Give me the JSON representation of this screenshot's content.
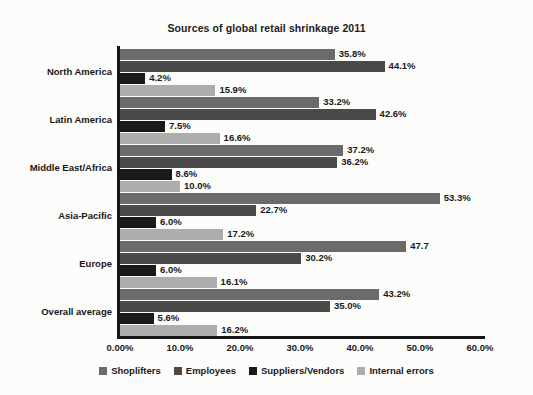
{
  "chart_data": {
    "type": "bar",
    "orientation": "horizontal",
    "title": "Sources of global retail shrinkage 2011",
    "xlabel": "",
    "ylabel": "",
    "xlim": [
      0,
      60
    ],
    "grid": false,
    "legend_position": "bottom",
    "xticks": [
      "0.00%",
      "10.0%",
      "20.0%",
      "30.0%",
      "40.0%",
      "50.0%",
      "60.0%"
    ],
    "xtick_values": [
      0,
      10,
      20,
      30,
      40,
      50,
      60
    ],
    "categories": [
      "North America",
      "Latin America",
      "Middle East/Africa",
      "Asia-Pacific",
      "Europe",
      "Overall average"
    ],
    "series": [
      {
        "name": "Shoplifters",
        "color": "#6b6b6b",
        "values": [
          35.8,
          33.2,
          37.2,
          53.3,
          47.7,
          43.2
        ],
        "labels": [
          "35.8%",
          "33.2%",
          "37.2%",
          "53.3%",
          "47.7",
          "43.2%"
        ]
      },
      {
        "name": "Employees",
        "color": "#4a4a4a",
        "values": [
          44.1,
          42.6,
          36.2,
          22.7,
          30.2,
          35.0
        ],
        "labels": [
          "44.1%",
          "42.6%",
          "36.2%",
          "22.7%",
          "30.2%",
          "35.0%"
        ]
      },
      {
        "name": "Suppliers/Vendors",
        "color": "#1a1a1a",
        "values": [
          4.2,
          7.5,
          8.6,
          6.0,
          6.0,
          5.6
        ],
        "labels": [
          "4.2%",
          "7.5%",
          "8.6%",
          "6.0%",
          "6.0%",
          "5.6%"
        ]
      },
      {
        "name": "Internal errors",
        "color": "#adadad",
        "values": [
          15.9,
          16.6,
          10.0,
          17.2,
          16.1,
          16.2
        ],
        "labels": [
          "15.9%",
          "16.6%",
          "10.0%",
          "17.2%",
          "16.1%",
          "16.2%"
        ]
      }
    ]
  },
  "colors": {
    "background": "#fcfcfa",
    "axis": "#151515",
    "text": "#1a1a1a"
  }
}
